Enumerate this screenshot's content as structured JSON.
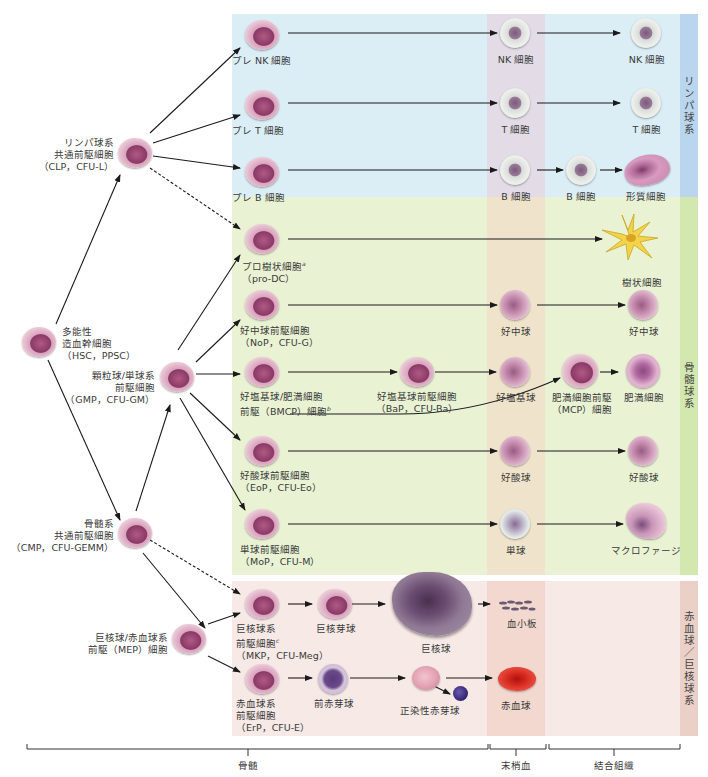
{
  "panels": {
    "lymphoid": {
      "label": "リンパ球系",
      "color": "#dbeef6",
      "strip_color": "#b9d6ee"
    },
    "myeloid": {
      "label": "骨髄球系",
      "color": "#e9f3d4",
      "strip_color": "#d3e8ae"
    },
    "erythroid": {
      "label": "赤血球／巨核球系",
      "color": "#f6e9e6",
      "strip_color": "#ead0c7"
    },
    "peripheral_band_colors": {
      "lymphoid": "#e3dce6",
      "myeloid": "#efe3cb",
      "erythroid": "#f2d8cf"
    }
  },
  "cells": {
    "hsc": {
      "name": "多能性",
      "line2": "造血幹細胞",
      "abbr": "（HSC，PPSC）"
    },
    "clp": {
      "name": "リンパ球系",
      "line2": "共通前駆細胞",
      "abbr": "（CLP，CFU-L）"
    },
    "gmp": {
      "name": "顆粒球/単球系",
      "line2": "前駆細胞",
      "abbr": "（GMP，CFU-GM）"
    },
    "cmp": {
      "name": "骨髄系",
      "line2": "共通前駆細胞",
      "abbr": "（CMP，CFU-GEMM）"
    },
    "mep": {
      "name": "巨核球/赤血球系",
      "line2": "前駆（MEP）細胞"
    },
    "pre_nk": {
      "name": "プレ NK 細胞"
    },
    "pre_t": {
      "name": "プレ T 細胞"
    },
    "pre_b": {
      "name": "プレ B 細胞"
    },
    "nk_blood": {
      "name": "NK 細胞"
    },
    "t_blood": {
      "name": "T 細胞"
    },
    "b_blood": {
      "name": "B 細胞"
    },
    "nk_tissue": {
      "name": "NK 細胞"
    },
    "t_tissue": {
      "name": "T 細胞"
    },
    "b_tissue": {
      "name": "B 細胞"
    },
    "plasma": {
      "name": "形質細胞"
    },
    "pro_dc": {
      "name": "プロ樹状細胞",
      "sup": "a",
      "abbr": "（pro-DC）"
    },
    "dc": {
      "name": "樹状細胞"
    },
    "nop": {
      "name": "好中球前駆細胞",
      "abbr": "（NoP，CFU-G）"
    },
    "neut_blood": {
      "name": "好中球"
    },
    "neut_tissue": {
      "name": "好中球"
    },
    "bmcp": {
      "name": "好塩基球/肥満細胞",
      "line2": "前駆（BMCP）細胞",
      "sup": "b"
    },
    "bap": {
      "name": "好塩基球前駆細胞",
      "abbr": "（BaP，CFU-Ba）"
    },
    "baso": {
      "name": "好塩基球"
    },
    "mcp": {
      "name": "肥満細胞前駆",
      "line2": "（MCP）細胞"
    },
    "mast": {
      "name": "肥満細胞"
    },
    "eop": {
      "name": "好酸球前駆細胞",
      "abbr": "（EoP，CFU-Eo）"
    },
    "eos_blood": {
      "name": "好酸球"
    },
    "eos_tissue": {
      "name": "好酸球"
    },
    "mop": {
      "name": "単球前駆細胞",
      "abbr": "（MoP，CFU-M）"
    },
    "mono": {
      "name": "単球"
    },
    "macro": {
      "name": "マクロファージ"
    },
    "mkp": {
      "name": "巨核球系",
      "line2": "前駆細胞",
      "sup": "c",
      "abbr": "（MKP，CFU-Meg）"
    },
    "megakaryoblast": {
      "name": "巨核芽球"
    },
    "megakaryocyte": {
      "name": "巨核球"
    },
    "platelet": {
      "name": "血小板"
    },
    "erp": {
      "name": "赤血球系",
      "line2": "前駆細胞",
      "abbr": "（ErP，CFU-E）"
    },
    "proerythroblast": {
      "name": "前赤芽球"
    },
    "normoblast": {
      "name": "正染性赤芽球"
    },
    "rbc": {
      "name": "赤血球"
    }
  },
  "scale": {
    "bone_marrow": "骨髄",
    "peripheral_blood": "末梢血",
    "connective_tissue": "結合組織"
  }
}
